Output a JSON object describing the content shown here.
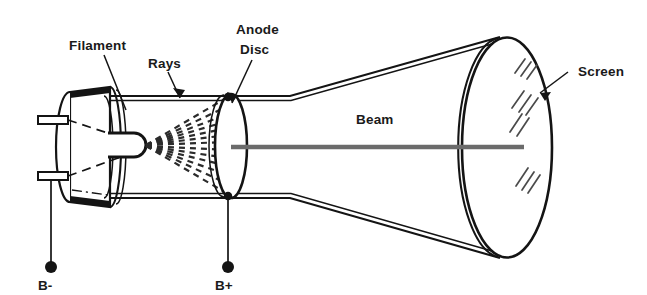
{
  "diagram": {
    "background_color": "#ffffff",
    "ink_color": "#141414",
    "beam_color": "#6b6b6b",
    "glint_color": "#4a4a4a"
  },
  "labels": {
    "filament": "Filament",
    "rays": "Rays",
    "anode_line1": "Anode",
    "anode_line2": "Disc",
    "beam": "Beam",
    "screen": "Screen",
    "b_minus": "B-",
    "b_plus": "B+"
  },
  "parts": [
    {
      "id": "base",
      "name": "tube-base",
      "label": ""
    },
    {
      "id": "filament",
      "name": "filament",
      "label": "Filament"
    },
    {
      "id": "rays",
      "name": "electron-rays",
      "label": "Rays"
    },
    {
      "id": "anode-disc",
      "name": "anode-disc",
      "label": "Anode Disc"
    },
    {
      "id": "beam",
      "name": "electron-beam",
      "label": "Beam"
    },
    {
      "id": "screen",
      "name": "screen",
      "label": "Screen"
    },
    {
      "id": "terminal-neg",
      "name": "terminal-b-minus",
      "label": "B-"
    },
    {
      "id": "terminal-pos",
      "name": "terminal-b-plus",
      "label": "B+"
    }
  ],
  "ray_count": 13,
  "pin_count": 2,
  "glint_count": 4
}
